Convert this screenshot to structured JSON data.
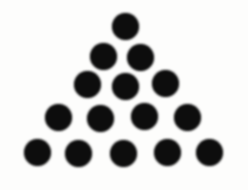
{
  "figure": {
    "name": "triangular-dot-pattern",
    "background_color": "#fdfdfc",
    "dot_color": "#0d0d0d",
    "dot_diameter_px": 27,
    "total_dots": 15,
    "row_counts": [
      1,
      2,
      3,
      4,
      5
    ],
    "dots": [
      {
        "x": 125,
        "y": 26
      },
      {
        "x": 103,
        "y": 56
      },
      {
        "x": 140,
        "y": 57
      },
      {
        "x": 87,
        "y": 84
      },
      {
        "x": 125,
        "y": 86
      },
      {
        "x": 165,
        "y": 83
      },
      {
        "x": 58,
        "y": 117
      },
      {
        "x": 100,
        "y": 118
      },
      {
        "x": 144,
        "y": 116
      },
      {
        "x": 187,
        "y": 117
      },
      {
        "x": 37,
        "y": 152
      },
      {
        "x": 78,
        "y": 153
      },
      {
        "x": 123,
        "y": 153
      },
      {
        "x": 167,
        "y": 152
      },
      {
        "x": 209,
        "y": 152
      }
    ]
  }
}
